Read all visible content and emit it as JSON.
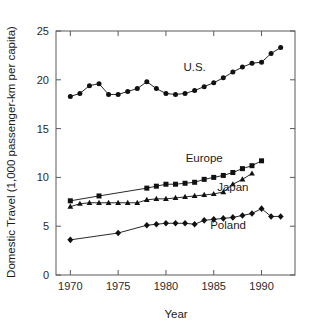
{
  "chart_data": {
    "type": "line",
    "title": "",
    "xlabel": "Year",
    "ylabel": "Domestic Travel (1,000 passenger-km per capita)",
    "xlim": [
      1968.5,
      1993.5
    ],
    "ylim": [
      0,
      25
    ],
    "xticks": [
      1970,
      1975,
      1980,
      1985,
      1990
    ],
    "yticks": [
      0,
      5,
      10,
      15,
      20,
      25
    ],
    "xtick_labels": [
      "1970",
      "1975",
      "1980",
      "1985",
      "1990"
    ],
    "ytick_labels": [
      "0",
      "5",
      "10",
      "15",
      "20",
      "25"
    ],
    "grid": false,
    "legend": "inline-annotations",
    "series": [
      {
        "name": "U.S.",
        "marker": "circle",
        "label_x": 1983.0,
        "label_y": 20.9,
        "points": [
          {
            "x": 1970,
            "y": 18.3
          },
          {
            "x": 1971,
            "y": 18.6
          },
          {
            "x": 1972,
            "y": 19.4
          },
          {
            "x": 1973,
            "y": 19.6
          },
          {
            "x": 1974,
            "y": 18.5
          },
          {
            "x": 1975,
            "y": 18.5
          },
          {
            "x": 1976,
            "y": 18.8
          },
          {
            "x": 1977,
            "y": 19.1
          },
          {
            "x": 1978,
            "y": 19.8
          },
          {
            "x": 1979,
            "y": 19.1
          },
          {
            "x": 1980,
            "y": 18.6
          },
          {
            "x": 1981,
            "y": 18.5
          },
          {
            "x": 1982,
            "y": 18.6
          },
          {
            "x": 1983,
            "y": 18.9
          },
          {
            "x": 1984,
            "y": 19.3
          },
          {
            "x": 1985,
            "y": 19.7
          },
          {
            "x": 1986,
            "y": 20.2
          },
          {
            "x": 1987,
            "y": 20.8
          },
          {
            "x": 1988,
            "y": 21.3
          },
          {
            "x": 1989,
            "y": 21.7
          },
          {
            "x": 1990,
            "y": 21.8
          },
          {
            "x": 1991,
            "y": 22.7
          },
          {
            "x": 1992,
            "y": 23.3
          }
        ]
      },
      {
        "name": "Europe",
        "marker": "square",
        "label_x": 1984.0,
        "label_y": 11.6,
        "points": [
          {
            "x": 1970,
            "y": 7.6
          },
          {
            "x": 1973,
            "y": 8.1
          },
          {
            "x": 1978,
            "y": 8.9
          },
          {
            "x": 1979,
            "y": 9.1
          },
          {
            "x": 1980,
            "y": 9.3
          },
          {
            "x": 1981,
            "y": 9.3
          },
          {
            "x": 1982,
            "y": 9.4
          },
          {
            "x": 1983,
            "y": 9.5
          },
          {
            "x": 1984,
            "y": 9.8
          },
          {
            "x": 1985,
            "y": 10.0
          },
          {
            "x": 1986,
            "y": 10.2
          },
          {
            "x": 1987,
            "y": 10.5
          },
          {
            "x": 1988,
            "y": 10.9
          },
          {
            "x": 1989,
            "y": 11.2
          },
          {
            "x": 1990,
            "y": 11.7
          }
        ]
      },
      {
        "name": "Japan",
        "marker": "triangle",
        "label_x": 1987.0,
        "label_y": 8.6,
        "points": [
          {
            "x": 1970,
            "y": 7.0
          },
          {
            "x": 1971,
            "y": 7.3
          },
          {
            "x": 1972,
            "y": 7.4
          },
          {
            "x": 1973,
            "y": 7.4
          },
          {
            "x": 1974,
            "y": 7.4
          },
          {
            "x": 1975,
            "y": 7.4
          },
          {
            "x": 1976,
            "y": 7.4
          },
          {
            "x": 1977,
            "y": 7.4
          },
          {
            "x": 1978,
            "y": 7.7
          },
          {
            "x": 1979,
            "y": 7.8
          },
          {
            "x": 1980,
            "y": 7.8
          },
          {
            "x": 1981,
            "y": 7.9
          },
          {
            "x": 1982,
            "y": 8.0
          },
          {
            "x": 1983,
            "y": 8.1
          },
          {
            "x": 1984,
            "y": 8.2
          },
          {
            "x": 1985,
            "y": 8.3
          },
          {
            "x": 1986,
            "y": 8.5
          },
          {
            "x": 1987,
            "y": 9.3
          },
          {
            "x": 1988,
            "y": 9.8
          },
          {
            "x": 1989,
            "y": 10.4
          }
        ]
      },
      {
        "name": "Poland",
        "marker": "diamond",
        "label_x": 1986.5,
        "label_y": 4.7,
        "points": [
          {
            "x": 1970,
            "y": 3.6
          },
          {
            "x": 1975,
            "y": 4.3
          },
          {
            "x": 1978,
            "y": 5.1
          },
          {
            "x": 1979,
            "y": 5.2
          },
          {
            "x": 1980,
            "y": 5.3
          },
          {
            "x": 1981,
            "y": 5.3
          },
          {
            "x": 1982,
            "y": 5.3
          },
          {
            "x": 1983,
            "y": 5.2
          },
          {
            "x": 1984,
            "y": 5.6
          },
          {
            "x": 1985,
            "y": 5.7
          },
          {
            "x": 1986,
            "y": 5.8
          },
          {
            "x": 1987,
            "y": 5.9
          },
          {
            "x": 1988,
            "y": 6.1
          },
          {
            "x": 1989,
            "y": 6.3
          },
          {
            "x": 1990,
            "y": 6.8
          },
          {
            "x": 1991,
            "y": 6.0
          },
          {
            "x": 1992,
            "y": 6.0
          }
        ]
      }
    ]
  },
  "colors": {
    "ink": "#111111",
    "axis": "#58585a",
    "background": "#ffffff"
  }
}
